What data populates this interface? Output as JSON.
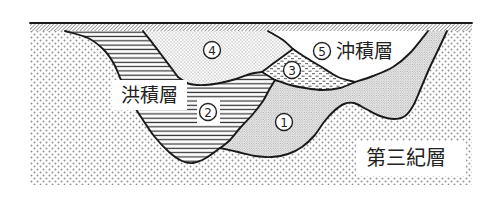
{
  "figure": {
    "labels": {
      "diluvium": "洪積層",
      "alluvium": "沖積層",
      "tertiary": "第三紀層"
    },
    "layer_markers": {
      "layer_1": "1",
      "layer_2": "2",
      "layer_3": "3",
      "layer_4": "4",
      "layer_5": "5"
    }
  },
  "colors": {
    "line": "#1a1a1a",
    "pattern": "#8f8f8f",
    "background": "#ffffff"
  }
}
